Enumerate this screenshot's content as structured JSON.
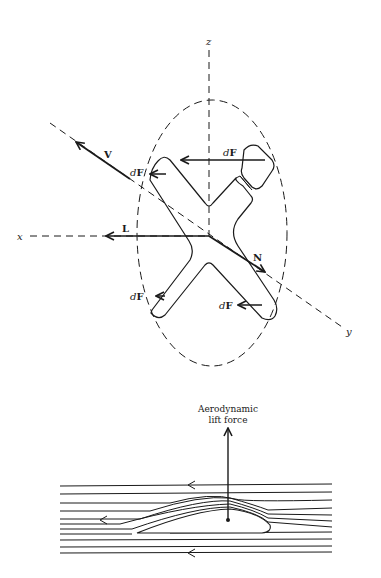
{
  "figure_top": {
    "axes": {
      "z": "z",
      "x": "x",
      "y": "y"
    },
    "vectors": {
      "V": "V",
      "L": "L",
      "N": "N"
    },
    "force_labels": {
      "top": {
        "d": "d",
        "F": "F"
      },
      "left": {
        "d": "d",
        "F": "F"
      },
      "bottom_left": {
        "d": "d",
        "F": "F"
      },
      "bottom_right": {
        "d": "d",
        "F": "F"
      }
    }
  },
  "figure_bottom": {
    "lift_label_line1": "Aerodynamic",
    "lift_label_line2": "lift force"
  },
  "colors": {
    "ink": "#1a1a1a",
    "background": "#ffffff"
  }
}
